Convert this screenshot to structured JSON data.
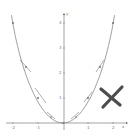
{
  "diagram": {
    "title": "",
    "function": "y = x^2",
    "axes": {
      "x_label": "x",
      "y_label": "y",
      "x_ticks": [
        "-2",
        "-1",
        "0",
        "1",
        "2"
      ],
      "y_ticks": [
        "1",
        "2",
        "3",
        "4"
      ]
    },
    "points": [
      {
        "x": -2,
        "y": 4
      },
      {
        "x": -1.5,
        "y": 2.25
      },
      {
        "x": -1,
        "y": 1
      },
      {
        "x": -0.5,
        "y": 0.25
      },
      {
        "x": 0,
        "y": 0
      },
      {
        "x": 0.5,
        "y": 0.25
      },
      {
        "x": 1,
        "y": 1
      },
      {
        "x": 1.5,
        "y": 2.25
      },
      {
        "x": 2,
        "y": 4
      }
    ],
    "tangent_points": [
      -1.5,
      -1,
      -0.5,
      0.5,
      1,
      1.5
    ],
    "annotation": {
      "symbol": "X",
      "color": "#555555"
    },
    "colors": {
      "curve": "#888888",
      "axis": "#666666",
      "tangent": "#777777",
      "mark": "#4d4d4d"
    }
  }
}
